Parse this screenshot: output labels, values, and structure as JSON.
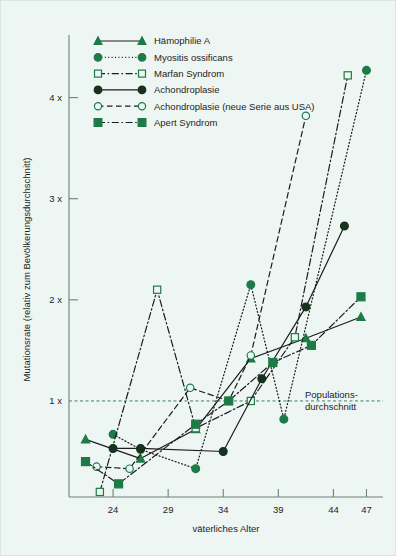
{
  "chart_data": {
    "type": "line",
    "title": "",
    "xlabel": "väterliches Alter",
    "ylabel": "Mutationsrate (relativ zum Bevölkerungsdurchschnitt)",
    "xlim": [
      20,
      48.5
    ],
    "ylim": [
      0.05,
      4.55
    ],
    "xticks": [
      24,
      29,
      34,
      39,
      44,
      47
    ],
    "xticklabels": [
      "24",
      "29",
      "34",
      "39",
      "44",
      "47"
    ],
    "yticks": [
      1,
      2,
      3,
      4
    ],
    "yticklabels": [
      "1 x",
      "2 x",
      "3 x",
      "4 x"
    ],
    "grid": false,
    "legend_position": "top-left",
    "reference_line": {
      "value": 1,
      "label": "Populations-\ndurchschnitt",
      "label_line1": "Populations-",
      "label_line2": "durchschnitt",
      "style": "dashed",
      "color": "#3f7d63"
    },
    "series": [
      {
        "name": "Hämophilie A",
        "marker": "triangle",
        "marker_filled": true,
        "linestyle": "solid",
        "color": "#1c1c1c",
        "marker_color": "#1e7a46",
        "x": [
          21.5,
          26.5,
          31.5,
          36.5,
          41.5,
          46.5
        ],
        "y": [
          0.62,
          0.43,
          0.72,
          1.42,
          1.62,
          1.83
        ]
      },
      {
        "name": "Myositis ossificans",
        "marker": "circle",
        "marker_filled": true,
        "linestyle": "dotted",
        "color": "#1c1c1c",
        "marker_color": "#1e7a46",
        "x": [
          24,
          26.5,
          31.5,
          36.5,
          39.5,
          47
        ],
        "y": [
          0.67,
          0.52,
          0.33,
          2.15,
          0.82,
          4.27
        ]
      },
      {
        "name": "Marfan Syndrom",
        "marker": "square",
        "marker_filled": false,
        "linestyle": "dashdot",
        "color": "#1c1c1c",
        "marker_color": "#1e7a46",
        "x": [
          22.8,
          28.0,
          31.5,
          36.5,
          40.5,
          45.3
        ],
        "y": [
          0.1,
          2.1,
          0.73,
          1.0,
          1.63,
          4.22
        ]
      },
      {
        "name": "Achondroplasie",
        "marker": "circle",
        "marker_filled": true,
        "linestyle": "solid",
        "color": "#1c1c1c",
        "marker_color": "#17321f",
        "x": [
          24.0,
          26.5,
          34.0,
          37.5,
          41.5,
          45.0
        ],
        "y": [
          0.53,
          0.53,
          0.5,
          1.22,
          1.93,
          2.73
        ]
      },
      {
        "name": "Achondroplasie (neue Serie aus USA)",
        "marker": "circle",
        "marker_filled": false,
        "linestyle": "dashed",
        "color": "#1c1c1c",
        "marker_color": "#1e7a46",
        "x": [
          22.5,
          25.5,
          31.0,
          34.5,
          36.5,
          41.5
        ],
        "y": [
          0.35,
          0.33,
          1.13,
          1.0,
          1.45,
          3.82
        ]
      },
      {
        "name": "Apert Syndrom",
        "marker": "square",
        "marker_filled": true,
        "linestyle": "dashdot",
        "color": "#1c1c1c",
        "marker_color": "#1e7a46",
        "x": [
          21.5,
          24.5,
          31.5,
          34.5,
          38.5,
          42.0,
          46.5
        ],
        "y": [
          0.4,
          0.18,
          0.77,
          1.0,
          1.38,
          1.55,
          2.03
        ]
      }
    ]
  },
  "legend": {
    "entries": [
      {
        "label": "Hämophilie A"
      },
      {
        "label": "Myositis ossificans"
      },
      {
        "label": "Marfan Syndrom"
      },
      {
        "label": "Achondroplasie"
      },
      {
        "label": "Achondroplasie (neue Serie aus USA)"
      },
      {
        "label": "Apert Syndrom"
      }
    ]
  },
  "colors": {
    "background": "#eef6f3",
    "axis": "#6f7f79",
    "line": "#1c1c1c",
    "marker_green": "#1e7a46",
    "marker_dark": "#17321f",
    "reference": "#3f7d63"
  }
}
